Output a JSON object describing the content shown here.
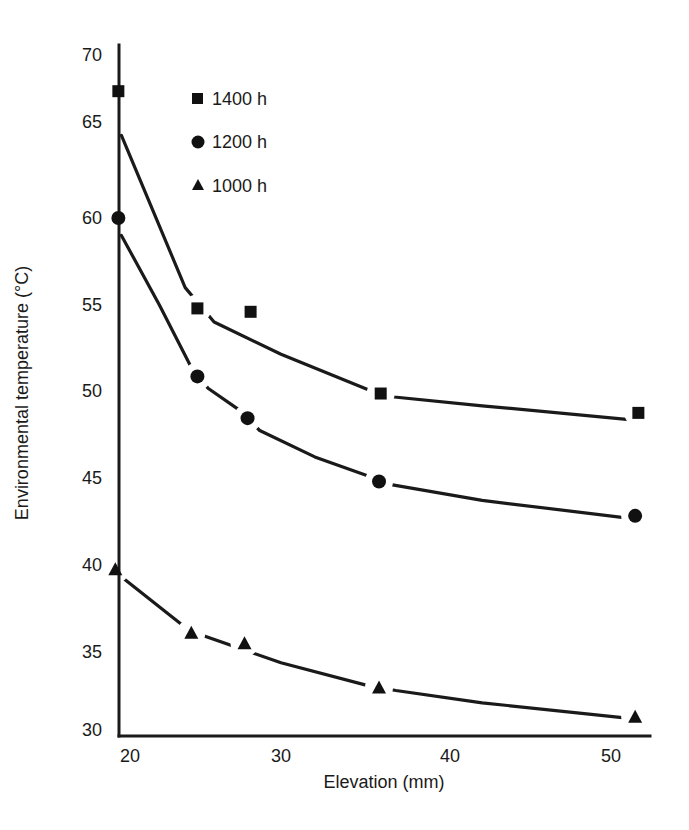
{
  "chart_data": {
    "type": "scatter",
    "title": "",
    "xlabel": "Elevation (mm)",
    "ylabel": "Environmental temperature (°C)",
    "xlim": [
      19,
      52.5
    ],
    "ylim": [
      30,
      70
    ],
    "x_ticks": [
      20,
      30,
      40,
      50
    ],
    "y_ticks": [
      30,
      35,
      40,
      45,
      50,
      55,
      60,
      65,
      70
    ],
    "grid": false,
    "legend_position": "upper-left-inside",
    "series": [
      {
        "name": "1400 h",
        "marker": "square",
        "points": [
          {
            "x": 19.3,
            "y": 67.3
          },
          {
            "x": 24.5,
            "y": 54.8
          },
          {
            "x": 28.0,
            "y": 54.6
          },
          {
            "x": 35.9,
            "y": 49.8
          },
          {
            "x": 51.7,
            "y": 48.7
          }
        ],
        "fit_curve": [
          {
            "x": 19.5,
            "y": 64.3
          },
          {
            "x": 23.7,
            "y": 56.0
          },
          {
            "x": 25.6,
            "y": 54.0
          },
          {
            "x": 30.0,
            "y": 52.1
          },
          {
            "x": 35.2,
            "y": 50.0
          },
          {
            "x": 36.7,
            "y": 49.6
          },
          {
            "x": 42.0,
            "y": 49.1
          },
          {
            "x": 51.3,
            "y": 48.3
          }
        ]
      },
      {
        "name": "1200 h",
        "marker": "circle",
        "points": [
          {
            "x": 19.3,
            "y": 60.0
          },
          {
            "x": 24.5,
            "y": 50.8
          },
          {
            "x": 27.8,
            "y": 48.4
          },
          {
            "x": 35.8,
            "y": 44.8
          },
          {
            "x": 51.5,
            "y": 42.8
          }
        ],
        "fit_curve": [
          {
            "x": 19.5,
            "y": 59.0
          },
          {
            "x": 22.0,
            "y": 55.0
          },
          {
            "x": 24.0,
            "y": 51.5
          },
          {
            "x": 25.2,
            "y": 50.1
          },
          {
            "x": 27.2,
            "y": 48.9
          },
          {
            "x": 28.6,
            "y": 47.7
          },
          {
            "x": 32.0,
            "y": 46.2
          },
          {
            "x": 35.2,
            "y": 45.1
          },
          {
            "x": 36.6,
            "y": 44.6
          },
          {
            "x": 42.0,
            "y": 43.7
          },
          {
            "x": 50.8,
            "y": 42.7
          }
        ]
      },
      {
        "name": "1000 h",
        "marker": "triangle",
        "points": [
          {
            "x": 19.1,
            "y": 39.7
          },
          {
            "x": 24.1,
            "y": 36.1
          },
          {
            "x": 27.6,
            "y": 35.5
          },
          {
            "x": 35.8,
            "y": 32.7
          },
          {
            "x": 51.5,
            "y": 30.8
          }
        ],
        "fit_curve": [
          {
            "x": 19.6,
            "y": 39.2
          },
          {
            "x": 23.4,
            "y": 36.6
          },
          {
            "x": 25.0,
            "y": 35.9
          },
          {
            "x": 30.0,
            "y": 34.3
          },
          {
            "x": 35.2,
            "y": 32.8
          },
          {
            "x": 36.8,
            "y": 32.5
          },
          {
            "x": 42.0,
            "y": 31.7
          },
          {
            "x": 51.0,
            "y": 30.7
          }
        ]
      }
    ]
  },
  "legend": {
    "items": [
      {
        "label": "1400 h",
        "marker": "square"
      },
      {
        "label": "1200 h",
        "marker": "circle"
      },
      {
        "label": "1000 h",
        "marker": "triangle"
      }
    ]
  },
  "axes": {
    "x_tick_labels": [
      "20",
      "30",
      "40",
      "50"
    ],
    "y_tick_labels": [
      "70",
      "65",
      "60",
      "55",
      "50",
      "45",
      "40",
      "35",
      "30"
    ]
  }
}
